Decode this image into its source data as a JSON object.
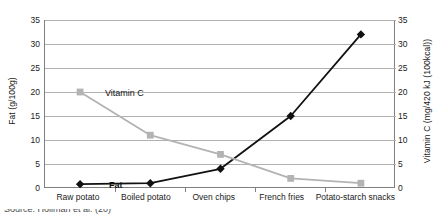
{
  "chart_data": {
    "type": "line",
    "title": "",
    "subtitle": "",
    "categories": [
      "Raw potato",
      "Boiled potato",
      "Oven chips",
      "French fries",
      "Potato-starch snacks"
    ],
    "series": [
      {
        "name": "Fat",
        "label": "Fat",
        "axis": "left",
        "color": "#111111",
        "marker": "diamond",
        "values": [
          0.8,
          1.0,
          4.0,
          15.0,
          32.0
        ]
      },
      {
        "name": "Vitamin C",
        "label": "Vitamin C",
        "axis": "right",
        "color": "#b3b3b3",
        "marker": "square",
        "values": [
          20.0,
          11.0,
          7.0,
          2.0,
          1.0
        ]
      }
    ],
    "xlabel": "",
    "ylabel": "Fat (g/100g)",
    "y2label": "Vitamin C (mg/420 kJ (100kcal))",
    "ylim": [
      0,
      35
    ],
    "y2lim": [
      0,
      35
    ],
    "yticks": [
      "0",
      "5",
      "10",
      "15",
      "20",
      "25",
      "30",
      "35"
    ],
    "y2ticks": [
      "0",
      "5",
      "10",
      "15",
      "20",
      "25",
      "30",
      "35"
    ],
    "grid": "horizontal",
    "gridcolor": "#b0b0b0",
    "legend": "inline-labels"
  },
  "axes": {
    "left_title": "Fat (g/100g)",
    "right_title": "Vitamin C (mg/420 kJ (100kcal))"
  },
  "caption": {
    "text": "Source: Hollman et al. (20)"
  }
}
